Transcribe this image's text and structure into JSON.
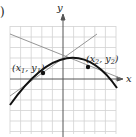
{
  "figure": {
    "panel_marker": ")",
    "axes": {
      "x_label": "x",
      "y_label": "y"
    },
    "points": [
      {
        "label_base": "(x",
        "sub1": "1",
        "sep": ", y",
        "sub2": "1",
        "close": ")"
      },
      {
        "label_base": "(x",
        "sub1": "2",
        "sep": ", y",
        "sub2": "2",
        "close": ")"
      }
    ],
    "colors": {
      "curve": "#111111",
      "tangent": "#8a8a8a",
      "grid": "#cfcfcf",
      "axis": "#555555"
    }
  }
}
